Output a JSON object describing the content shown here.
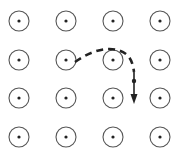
{
  "diagram": {
    "field": {
      "symbol": "out-of-page",
      "rows": 4,
      "cols": 4,
      "col_x": [
        19,
        66,
        113,
        160
      ],
      "row_y": [
        21,
        60,
        98,
        137
      ],
      "radius": 10,
      "dot_radius": 1.6,
      "stroke_color": "#555555",
      "dot_color": "#222222"
    },
    "trajectory": {
      "style": "dashed",
      "color": "#222222",
      "path": "M 75 62 C 92 50, 112 44, 126 54 C 131 58, 133 64, 134 72"
    },
    "particle": {
      "x": 134,
      "y": 81,
      "radius": 2.2,
      "color": "#222222"
    },
    "velocity_arrow": {
      "x": 134,
      "y1": 72,
      "y2": 104,
      "direction": "down",
      "color": "#222222"
    }
  }
}
